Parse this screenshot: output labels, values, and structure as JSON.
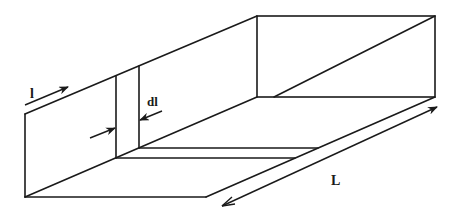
{
  "diagram": {
    "type": "3d-box-perspective",
    "labels": {
      "position": "l",
      "slice_thickness": "dl",
      "length": "L"
    },
    "colors": {
      "line": "#1a1a1a",
      "background": "#ffffff"
    }
  }
}
